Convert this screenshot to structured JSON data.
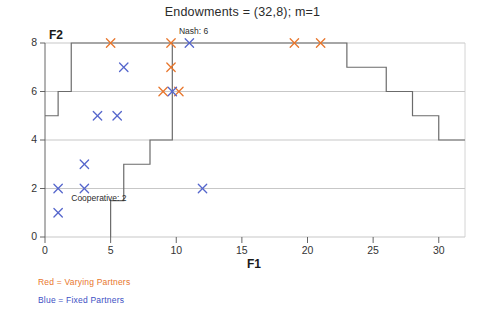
{
  "chart_data": {
    "type": "scatter",
    "title": "Endowments = (32,8); m=1",
    "xlabel": "F1",
    "ylabel": "F2",
    "xlim": [
      0,
      32
    ],
    "ylim": [
      0,
      8
    ],
    "xticks": [
      0,
      5,
      10,
      15,
      20,
      25,
      30
    ],
    "yticks": [
      0,
      2,
      4,
      6,
      8
    ],
    "grid": true,
    "legend": {
      "position": "below-left",
      "entries": [
        {
          "label": "Red = Varying Partners",
          "color": "#e8762c"
        },
        {
          "label": "Blue = Fixed Partners",
          "color": "#3c4fc4"
        }
      ]
    },
    "annotations": [
      {
        "text": "Nash: 6",
        "x": 10.2,
        "y": 8.45
      },
      {
        "text": "Cooperative: 2",
        "x": 2.0,
        "y": 1.55
      }
    ],
    "series": [
      {
        "name": "Varying Partners",
        "color": "#e8762c",
        "marker": "x",
        "points": [
          {
            "x": 5,
            "y": 8
          },
          {
            "x": 9.6,
            "y": 8
          },
          {
            "x": 19,
            "y": 8
          },
          {
            "x": 21,
            "y": 8
          },
          {
            "x": 9.6,
            "y": 7
          },
          {
            "x": 9,
            "y": 6
          },
          {
            "x": 10.2,
            "y": 6
          }
        ]
      },
      {
        "name": "Fixed Partners",
        "color": "#5566cc",
        "marker": "x",
        "points": [
          {
            "x": 11,
            "y": 8
          },
          {
            "x": 6,
            "y": 7
          },
          {
            "x": 4,
            "y": 5
          },
          {
            "x": 5.5,
            "y": 5
          },
          {
            "x": 9.7,
            "y": 6
          },
          {
            "x": 3,
            "y": 3
          },
          {
            "x": 1,
            "y": 2
          },
          {
            "x": 3,
            "y": 2
          },
          {
            "x": 12,
            "y": 2
          },
          {
            "x": 1,
            "y": 1
          }
        ]
      }
    ],
    "boundary_upper": [
      {
        "x": 0,
        "y": 5
      },
      {
        "x": 1,
        "y": 5
      },
      {
        "x": 1,
        "y": 6
      },
      {
        "x": 2,
        "y": 6
      },
      {
        "x": 2,
        "y": 8
      },
      {
        "x": 23,
        "y": 8
      },
      {
        "x": 23,
        "y": 7
      },
      {
        "x": 26,
        "y": 7
      },
      {
        "x": 26,
        "y": 6
      },
      {
        "x": 28,
        "y": 6
      },
      {
        "x": 28,
        "y": 5
      },
      {
        "x": 30,
        "y": 5
      },
      {
        "x": 30,
        "y": 4
      },
      {
        "x": 32,
        "y": 4
      }
    ],
    "boundary_lower": [
      {
        "x": 9.7,
        "y": 8
      },
      {
        "x": 9.7,
        "y": 6
      },
      {
        "x": 9.7,
        "y": 4
      },
      {
        "x": 8,
        "y": 4
      },
      {
        "x": 8,
        "y": 3
      },
      {
        "x": 6,
        "y": 3
      },
      {
        "x": 6,
        "y": 1.5
      },
      {
        "x": 5,
        "y": 1.5
      },
      {
        "x": 5,
        "y": 0
      }
    ]
  }
}
